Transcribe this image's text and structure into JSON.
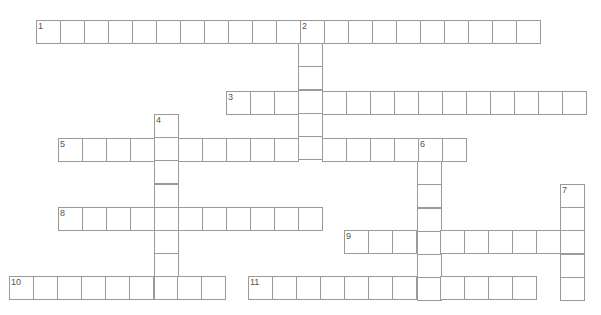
{
  "puzzle": {
    "cell_size": 24,
    "colors": {
      "border": "#9a9a9a",
      "background": "#ffffff",
      "number": "#555555"
    },
    "entries": [
      {
        "number": "1",
        "direction": "across",
        "x": 36,
        "y": 20,
        "length": 21
      },
      {
        "number": "2",
        "direction": "down",
        "x": 298,
        "y": 20,
        "length": 6
      },
      {
        "number": "3",
        "direction": "across",
        "x": 226,
        "y": 91,
        "length": 15
      },
      {
        "number": "4",
        "direction": "down",
        "x": 154,
        "y": 114,
        "length": 8
      },
      {
        "number": "5",
        "direction": "across",
        "x": 58,
        "y": 138,
        "length": 17
      },
      {
        "number": "6",
        "direction": "down",
        "x": 417,
        "y": 138,
        "length": 7
      },
      {
        "number": "7",
        "direction": "down",
        "x": 560,
        "y": 184,
        "length": 5
      },
      {
        "number": "8",
        "direction": "across",
        "x": 58,
        "y": 207,
        "length": 11
      },
      {
        "number": "9",
        "direction": "across",
        "x": 344,
        "y": 230,
        "length": 10
      },
      {
        "number": "10",
        "direction": "across",
        "x": 9,
        "y": 276,
        "length": 9
      },
      {
        "number": "11",
        "direction": "across",
        "x": 248,
        "y": 276,
        "length": 12
      }
    ]
  }
}
